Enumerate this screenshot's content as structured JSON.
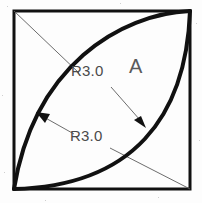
{
  "drawing": {
    "title": "Two intersecting arcs inscribed in a square",
    "kind": "engineering-sketch",
    "canvas": {
      "width": 202,
      "height": 203
    },
    "background_color": "#fdfdfd",
    "line_color": "#111111",
    "thin_line_color": "#555555",
    "text_color": "#4a4a4a",
    "square": {
      "name": "outer-square",
      "left": 14,
      "top": 11,
      "right": 190,
      "bottom": 189,
      "stroke_width": 3
    },
    "arcs": [
      {
        "name": "upper-left-arc",
        "radius_label": "R3.0",
        "from": {
          "x": 190,
          "y": 11
        },
        "to": {
          "x": 14,
          "y": 189
        },
        "bulge": "toward-top-left",
        "stroke_width": 4
      },
      {
        "name": "lower-right-arc",
        "radius_label": "R3.0",
        "from": {
          "x": 190,
          "y": 11
        },
        "to": {
          "x": 14,
          "y": 189
        },
        "bulge": "toward-bottom-right",
        "stroke_width": 4
      }
    ],
    "diagonals": [
      {
        "name": "upper-leader-diagonal",
        "from": {
          "x": 14,
          "y": 11
        },
        "to": {
          "x": 78,
          "y": 72
        }
      },
      {
        "name": "lower-leader-diagonal",
        "from": {
          "x": 113,
          "y": 150
        },
        "to": {
          "x": 190,
          "y": 189
        }
      }
    ],
    "leaders": [
      {
        "name": "leader-to-left-arc",
        "from": {
          "x": 73,
          "y": 133
        },
        "to": {
          "x": 37,
          "y": 113
        },
        "arrow": "at-end"
      },
      {
        "name": "leader-to-right-arc",
        "from": {
          "x": 112,
          "y": 88
        },
        "to": {
          "x": 145,
          "y": 126
        },
        "arrow": "at-end"
      }
    ],
    "labels": {
      "radius_top": "R3.0",
      "radius_bottom": "R3.0",
      "region_a": "A"
    }
  }
}
